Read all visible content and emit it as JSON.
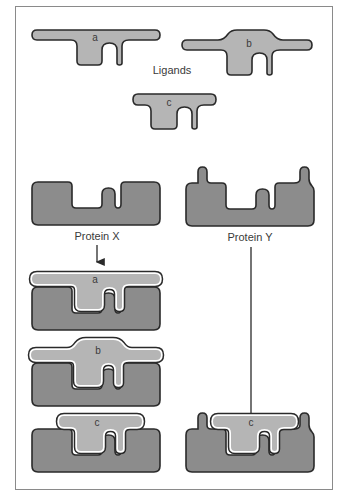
{
  "figure": {
    "ligands_label": "Ligands",
    "ligands": [
      {
        "id": "a",
        "label": "a"
      },
      {
        "id": "b",
        "label": "b"
      },
      {
        "id": "c",
        "label": "c"
      }
    ],
    "proteins": [
      {
        "id": "X",
        "label": "Protein X"
      },
      {
        "id": "Y",
        "label": "Protein Y"
      }
    ],
    "complexes": [
      {
        "protein": "X",
        "ligand": "a",
        "label": "a"
      },
      {
        "protein": "X",
        "ligand": "b",
        "label": "b"
      },
      {
        "protein": "X",
        "ligand": "c",
        "label": "c"
      },
      {
        "protein": "Y",
        "ligand": "c",
        "label": "c"
      }
    ],
    "colors": {
      "protein_fill": "#8c8c8c",
      "ligand_fill": "#b5b5b5",
      "outline": "#2a2a2a",
      "gap": "#ffffff",
      "border": "#8a8a8a"
    }
  }
}
